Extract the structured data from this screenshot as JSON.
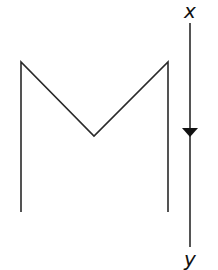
{
  "diagram": {
    "colors": {
      "stroke": "#2a2a2a",
      "background": "#ffffff"
    },
    "shape": {
      "name": "M-shaped profile",
      "points": [
        [
          21,
          212
        ],
        [
          21,
          62
        ],
        [
          94,
          136
        ],
        [
          168,
          62
        ],
        [
          168,
          212
        ]
      ]
    },
    "arrow": {
      "x": 190,
      "y_start": 23,
      "y_end": 247,
      "head_y": 128,
      "direction": "down"
    },
    "labels": {
      "top": "x",
      "bottom": "y"
    }
  }
}
